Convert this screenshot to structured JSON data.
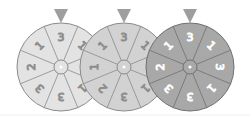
{
  "spinners": [
    {
      "id": "spinner-1",
      "center": [
        61,
        67
      ],
      "radius": 44,
      "fill": "#e3e3e3",
      "stroke": "#8a8a8a",
      "label_color": "#8c8c8c",
      "sections": [
        "3",
        "1",
        "3",
        "1",
        "3",
        "3",
        "2",
        "1"
      ],
      "pointer": "top",
      "pointer_color": "#9e9e9e"
    },
    {
      "id": "spinner-2",
      "center": [
        124,
        67
      ],
      "radius": 44,
      "fill": "#d2d2d2",
      "stroke": "#8a8a8a",
      "label_color": "#8c8c8c",
      "sections": [
        "3",
        "1",
        "3",
        "1",
        "3",
        "2",
        "1",
        "1"
      ],
      "pointer": "top",
      "pointer_color": "#9e9e9e"
    },
    {
      "id": "spinner-3",
      "center": [
        190,
        67
      ],
      "radius": 44,
      "fill": "#a8a8a8",
      "stroke": "#707070",
      "label_color": "#ffffff",
      "sections": [
        "3",
        "1",
        "3",
        "1",
        "3",
        "3",
        "2",
        "1"
      ],
      "pointer": "top",
      "pointer_color": "#9e9e9e"
    }
  ]
}
